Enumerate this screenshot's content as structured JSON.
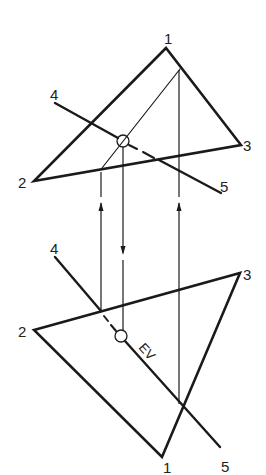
{
  "diagram": {
    "title": "",
    "colors": {
      "line": "#1a1a1a",
      "background": "#ffffff"
    },
    "top_view": {
      "labels": {
        "p1": "1",
        "p2": "2",
        "p3": "3",
        "p4": "4",
        "p5": "5"
      },
      "points": {
        "p1": [
          166,
          48
        ],
        "p2": [
          34,
          181
        ],
        "p3": [
          241,
          145
        ],
        "p4": [
          55,
          103
        ],
        "p5": [
          221,
          193
        ]
      },
      "pierce_point": [
        123,
        141
      ]
    },
    "front_view": {
      "labels": {
        "p1": "1",
        "p2": "2",
        "p3": "3",
        "p4": "4",
        "p5": "5",
        "ev": "EV"
      },
      "points": {
        "p1": [
          162,
          457
        ],
        "p2": [
          34,
          330
        ],
        "p3": [
          240,
          273
        ],
        "p4": [
          55,
          257
        ],
        "p5": [
          220,
          447
        ]
      },
      "pierce_point": [
        121,
        336
      ]
    },
    "projectors": [
      {
        "x": 101,
        "direction": "up"
      },
      {
        "x": 123,
        "direction": "down"
      },
      {
        "x": 179,
        "direction": "up"
      }
    ]
  }
}
